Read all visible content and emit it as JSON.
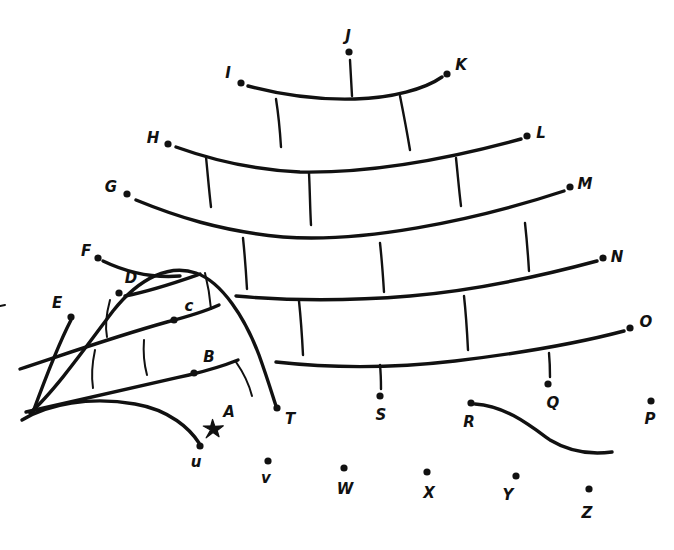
{
  "canvas": {
    "width": 674,
    "height": 550,
    "background": "#ffffff",
    "ink_color": "#111111"
  },
  "markers": {
    "star": {
      "name": "A",
      "label": "A",
      "x": 213,
      "y": 429,
      "label_x": 229,
      "label_y": 412,
      "shape": "star"
    }
  },
  "nodes": [
    {
      "id": "B",
      "label": "B",
      "x": 194,
      "y": 373,
      "label_x": 209,
      "label_y": 357
    },
    {
      "id": "C",
      "label": "c",
      "x": 174,
      "y": 320,
      "label_x": 189,
      "label_y": 306
    },
    {
      "id": "D",
      "label": "D",
      "x": 119,
      "y": 293,
      "label_x": 131,
      "label_y": 278
    },
    {
      "id": "E",
      "label": "E",
      "x": 71,
      "y": 317,
      "label_x": 57,
      "label_y": 303
    },
    {
      "id": "F",
      "label": "F",
      "x": 98,
      "y": 258,
      "label_x": 86,
      "label_y": 251
    },
    {
      "id": "G",
      "label": "G",
      "x": 127,
      "y": 194,
      "label_x": 111,
      "label_y": 187
    },
    {
      "id": "H",
      "label": "H",
      "x": 168,
      "y": 144,
      "label_x": 153,
      "label_y": 138
    },
    {
      "id": "I",
      "label": "I",
      "x": 241,
      "y": 83,
      "label_x": 228,
      "label_y": 73
    },
    {
      "id": "J",
      "label": "J",
      "x": 349,
      "y": 52,
      "label_x": 348,
      "label_y": 36
    },
    {
      "id": "K",
      "label": "K",
      "x": 447,
      "y": 74,
      "label_x": 461,
      "label_y": 65
    },
    {
      "id": "L",
      "label": "L",
      "x": 527,
      "y": 136,
      "label_x": 541,
      "label_y": 133
    },
    {
      "id": "M",
      "label": "M",
      "x": 570,
      "y": 187,
      "label_x": 585,
      "label_y": 184
    },
    {
      "id": "N",
      "label": "N",
      "x": 603,
      "y": 258,
      "label_x": 617,
      "label_y": 257
    },
    {
      "id": "O",
      "label": "O",
      "x": 630,
      "y": 328,
      "label_x": 646,
      "label_y": 322
    },
    {
      "id": "P",
      "label": "P",
      "x": 651,
      "y": 401,
      "label_x": 650,
      "label_y": 419
    },
    {
      "id": "Q",
      "label": "Q",
      "x": 548,
      "y": 384,
      "label_x": 553,
      "label_y": 403
    },
    {
      "id": "R",
      "label": "R",
      "x": 471,
      "y": 403,
      "label_x": 469,
      "label_y": 422
    },
    {
      "id": "S",
      "label": "S",
      "x": 380,
      "y": 396,
      "label_x": 381,
      "label_y": 415
    },
    {
      "id": "T",
      "label": "T",
      "x": 277,
      "y": 408,
      "label_x": 290,
      "label_y": 419
    },
    {
      "id": "U",
      "label": "u",
      "x": 200,
      "y": 446,
      "label_x": 196,
      "label_y": 462
    },
    {
      "id": "V",
      "label": "v",
      "x": 268,
      "y": 461,
      "label_x": 266,
      "label_y": 478
    },
    {
      "id": "W",
      "label": "W",
      "x": 344,
      "y": 468,
      "label_x": 345,
      "label_y": 489
    },
    {
      "id": "X",
      "label": "X",
      "x": 427,
      "y": 472,
      "label_x": 429,
      "label_y": 493
    },
    {
      "id": "Y",
      "label": "Y",
      "x": 516,
      "y": 476,
      "label_x": 508,
      "label_y": 495
    },
    {
      "id": "Z",
      "label": "Z",
      "x": 589,
      "y": 489,
      "label_x": 587,
      "label_y": 513
    }
  ],
  "paths": {
    "arc_1": "M 248 86 C 285 96 320 100 355 99 C 392 98 425 89 442 77",
    "arc_2": "M 176 147 C 215 161 255 170 300 172 C 355 173 430 164 521 139",
    "arc_3": "M 136 200 C 175 216 220 231 283 237 C 360 243 470 222 564 191",
    "arc_4": "M 236 296 C 290 301 350 301 410 296 C 480 290 545 275 597 261",
    "arc_5": "M 276 362 C 330 368 395 368 455 361 C 530 352 590 340 624 331",
    "spoke_j": "M 350 60 L 352 96",
    "spoke_1a": "M 276 99 C 279 118 280 131 281 147",
    "spoke_1b": "M 400 96 C 404 116 407 132 410 150",
    "spoke_2a": "M 206 157 C 208 177 209 190 211 207",
    "spoke_2b": "M 309 173 C 310 193 310 208 311 225",
    "spoke_2c": "M 456 158 C 458 177 459 190 461 206",
    "spoke_3a": "M 243 238 C 245 257 246 272 247 289",
    "spoke_3b": "M 380 243 C 382 261 383 276 384 292",
    "spoke_3c": "M 525 223 C 527 241 528 255 529 271",
    "spoke_4a": "M 299 301 C 301 320 302 335 303 355",
    "spoke_4b": "M 464 296 C 466 314 467 330 468 350",
    "spoke_s": "M 380 365 C 381 375 381 382 381 389",
    "spoke_q": "M 549 353 C 550 364 550 371 550 377",
    "bulge_outer": "M 30 413 C 55 391 88 344 113 311 C 140 277 170 264 196 273 C 222 282 245 318 259 355 C 268 380 273 397 276 406",
    "bulge_left_edge": "M 71 320 C 58 345 44 382 33 412",
    "bulge_base": "M 22 420 C 48 404 90 396 135 404 C 170 410 190 429 199 443",
    "ridge_f_d": "M 103 261 C 128 273 155 278 180 276",
    "ridge_d_top": "M 125 296 C 155 290 180 281 200 274",
    "ridge_c": "M 20 369 C 60 356 110 338 167 322 C 190 316 208 310 219 305",
    "ridge_b": "M 26 412 C 70 402 130 388 189 375 C 210 370 228 364 238 360",
    "tick_bulge_1": "M 110 300 C 106 315 105 327 107 337",
    "tick_bulge_2": "M 95 350 C 92 364 91 375 93 388",
    "tick_bulge_3": "M 144 340 C 143 353 144 364 147 375",
    "tick_bulge_4": "M 205 273 C 208 285 210 297 211 309",
    "tick_bulge_5": "M 236 362 C 243 372 249 384 252 396",
    "r_curve": "M 475 404 C 505 406 528 424 550 440 C 570 452 590 455 612 452"
  },
  "edge_mark": {
    "name": "left-edge-tick",
    "path": "M 0 306 L 5 305"
  }
}
